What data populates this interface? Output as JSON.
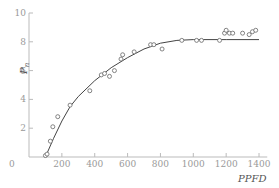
{
  "chart_data": {
    "type": "scatter",
    "title": "",
    "xlabel": "PPFD",
    "ylabel": "P_n",
    "ylabel_main": "P",
    "ylabel_sub": "n",
    "xlim": [
      0,
      1450
    ],
    "ylim": [
      0,
      10
    ],
    "x_ticks": [
      0,
      200,
      400,
      600,
      800,
      1000,
      1200,
      1400
    ],
    "y_ticks": [
      0,
      2,
      4,
      6,
      8,
      10
    ],
    "grid": false,
    "legend": null,
    "series": [
      {
        "name": "observed",
        "kind": "points",
        "marker": "open-circle",
        "points": [
          [
            100,
            0.1
          ],
          [
            110,
            0.2
          ],
          [
            130,
            1.1
          ],
          [
            145,
            2.1
          ],
          [
            175,
            2.8
          ],
          [
            250,
            3.6
          ],
          [
            370,
            4.6
          ],
          [
            440,
            5.7
          ],
          [
            460,
            5.8
          ],
          [
            490,
            5.6
          ],
          [
            520,
            6.0
          ],
          [
            560,
            6.8
          ],
          [
            570,
            7.1
          ],
          [
            640,
            7.3
          ],
          [
            740,
            7.8
          ],
          [
            760,
            7.8
          ],
          [
            810,
            7.5
          ],
          [
            930,
            8.1
          ],
          [
            1020,
            8.1
          ],
          [
            1050,
            8.1
          ],
          [
            1160,
            8.1
          ],
          [
            1190,
            8.6
          ],
          [
            1200,
            8.8
          ],
          [
            1220,
            8.6
          ],
          [
            1240,
            8.6
          ],
          [
            1300,
            8.6
          ],
          [
            1340,
            8.5
          ],
          [
            1360,
            8.7
          ],
          [
            1380,
            8.8
          ]
        ]
      },
      {
        "name": "fitted curve",
        "kind": "line",
        "points": [
          [
            100,
            0
          ],
          [
            150,
            1.3
          ],
          [
            200,
            2.5
          ],
          [
            250,
            3.5
          ],
          [
            300,
            4.2
          ],
          [
            400,
            5.3
          ],
          [
            500,
            6.2
          ],
          [
            600,
            6.9
          ],
          [
            700,
            7.5
          ],
          [
            800,
            7.9
          ],
          [
            900,
            8.1
          ],
          [
            1000,
            8.15
          ],
          [
            1200,
            8.15
          ],
          [
            1400,
            8.15
          ]
        ]
      }
    ]
  },
  "axes": {
    "x_label": "PPFD",
    "y_label_main": "P",
    "y_label_sub": "n",
    "x_tick_labels": [
      "0",
      "200",
      "400",
      "600",
      "800",
      "1000",
      "1200",
      "1400"
    ],
    "y_tick_labels": [
      "2",
      "4",
      "6",
      "8",
      "10"
    ]
  },
  "colors": {
    "axis": "#bbbbbb",
    "curve": "#444444",
    "marker": "#666666",
    "text": "#999999"
  }
}
